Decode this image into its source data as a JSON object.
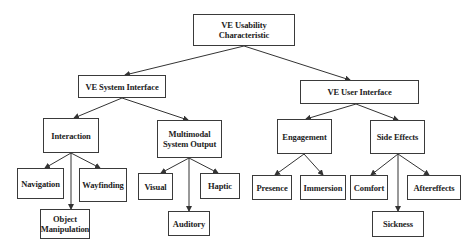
{
  "diagram": {
    "title": "VE Usability Characteristic",
    "nodes": {
      "root": "VE Usability\nCharacteristic",
      "system_interface": "VE System Interface",
      "user_interface": "VE User Interface",
      "interaction": "Interaction",
      "multimodal_output": "Multimodal\nSystem Output",
      "engagement": "Engagement",
      "side_effects": "Side Effects",
      "navigation": "Navigation",
      "wayfinding": "Wayfinding",
      "object_manipulation": "Object\nManipulation",
      "visual": "Visual",
      "haptic": "Haptic",
      "auditory": "Auditory",
      "presence": "Presence",
      "immersion": "Immersion",
      "comfort": "Comfort",
      "aftereffects": "Aftereffects",
      "sickness": "Sickness"
    },
    "edges": [
      [
        "root",
        "system_interface"
      ],
      [
        "root",
        "user_interface"
      ],
      [
        "system_interface",
        "interaction"
      ],
      [
        "system_interface",
        "multimodal_output"
      ],
      [
        "user_interface",
        "engagement"
      ],
      [
        "user_interface",
        "side_effects"
      ],
      [
        "interaction",
        "navigation"
      ],
      [
        "interaction",
        "wayfinding"
      ],
      [
        "interaction",
        "object_manipulation"
      ],
      [
        "multimodal_output",
        "visual"
      ],
      [
        "multimodal_output",
        "haptic"
      ],
      [
        "multimodal_output",
        "auditory"
      ],
      [
        "engagement",
        "presence"
      ],
      [
        "engagement",
        "immersion"
      ],
      [
        "side_effects",
        "comfort"
      ],
      [
        "side_effects",
        "aftereffects"
      ],
      [
        "side_effects",
        "sickness"
      ]
    ],
    "colors": {
      "line": "#333333",
      "box_border": "#3a3a3a",
      "background": "#ffffff",
      "text": "#222222"
    }
  }
}
